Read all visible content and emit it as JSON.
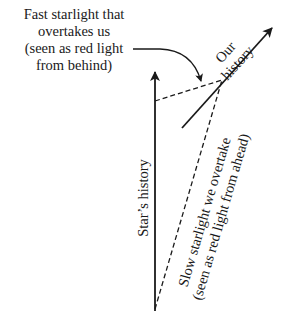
{
  "labels": {
    "fast_light": [
      "Fast starlight that",
      "overtakes us",
      "(seen as red light",
      "from behind)"
    ],
    "our_history": [
      "Our",
      "history"
    ],
    "stars_history": "Star’s history",
    "slow_light": [
      "Slow starlight we overtake",
      "(seen as red light from ahead)"
    ]
  },
  "colors": {
    "ink": "#1a1a1a",
    "background": "#ffffff"
  }
}
